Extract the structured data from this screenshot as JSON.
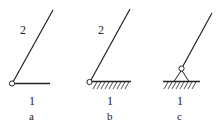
{
  "figure": {
    "panels": [
      {
        "id": "a",
        "sub_label": "a",
        "link_moving_label": "2",
        "link_fixed_label": "1",
        "description": "Link 2 pinned to link 1 (plain bar, no ground hatching)"
      },
      {
        "id": "b",
        "sub_label": "b",
        "link_moving_label": "2",
        "link_fixed_label": "1",
        "description": "Link 2 pinned directly to ground link 1 (hatched frame)"
      },
      {
        "id": "c",
        "sub_label": "c",
        "link_moving_label": "",
        "link_fixed_label": "1",
        "description": "Link pinned via triangular support to ground link 1 (hatched frame)"
      }
    ],
    "colors": {
      "line": "#222222",
      "background": "#ffffff"
    }
  }
}
